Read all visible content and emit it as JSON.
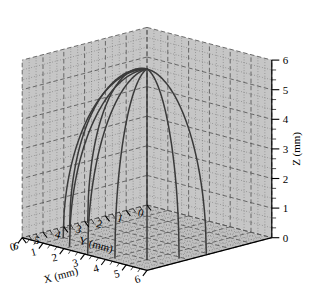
{
  "figure": {
    "name": "3d-dome-meridian-plot",
    "background": "#ffffff",
    "wall_fill": "#c6c6c6",
    "floor_fill": "#c0c0c0",
    "grid_color": "#555555",
    "curve_color": "#3a3a3a",
    "axis_color": "#000000"
  },
  "axes": {
    "x": {
      "label": "X (mm)",
      "unit": "mm",
      "min": 0,
      "max": 6,
      "ticks": [
        0,
        1,
        2,
        3,
        4,
        5,
        6
      ],
      "tick_labels": [
        "0",
        "1",
        "2",
        "3",
        "4",
        "5",
        "6"
      ],
      "minor_per_major": 2
    },
    "y": {
      "label": "Y (mm)",
      "unit": "mm",
      "min": 0,
      "max": 6,
      "ticks": [
        0,
        1,
        2,
        3,
        4,
        5,
        6
      ],
      "tick_labels": [
        "0",
        "1",
        "2",
        "3",
        "4",
        "5",
        "6"
      ],
      "minor_per_major": 2
    },
    "z": {
      "label": "Z (mm)",
      "unit": "mm",
      "min": 0,
      "max": 6,
      "ticks": [
        0,
        1,
        2,
        3,
        4,
        5,
        6
      ],
      "tick_labels": [
        "0",
        "1",
        "2",
        "3",
        "4",
        "5",
        "6"
      ],
      "minor_per_major": 2
    }
  },
  "chart_data": {
    "type": "line",
    "title": "",
    "xlabel": "X (mm)",
    "ylabel": "Y (mm)",
    "zlabel": "Z (mm)",
    "xlim": [
      0,
      6
    ],
    "ylim": [
      0,
      6
    ],
    "zlim": [
      0,
      6
    ],
    "grid": true,
    "legend": "none",
    "projection": "3d",
    "apex": {
      "x": 3.0,
      "y": 3.0,
      "z": 5.7
    },
    "base_center": {
      "x": 3.0,
      "y": 3.0,
      "z": 0.0
    },
    "base_radius": 2.85,
    "n_curves": 9,
    "series": [
      {
        "name": "meridian-1",
        "azimuth_deg": 0,
        "base_point": {
          "x": 5.85,
          "y": 3.0,
          "z": 0
        }
      },
      {
        "name": "meridian-2",
        "azimuth_deg": 22.5,
        "base_point": {
          "x": 5.63,
          "y": 4.09,
          "z": 0
        }
      },
      {
        "name": "meridian-3",
        "azimuth_deg": 45,
        "base_point": {
          "x": 5.02,
          "y": 5.02,
          "z": 0
        }
      },
      {
        "name": "meridian-4",
        "azimuth_deg": 67.5,
        "base_point": {
          "x": 4.09,
          "y": 5.63,
          "z": 0
        }
      },
      {
        "name": "meridian-5",
        "azimuth_deg": 90,
        "base_point": {
          "x": 3.0,
          "y": 5.85,
          "z": 0
        }
      },
      {
        "name": "meridian-6",
        "azimuth_deg": 112.5,
        "base_point": {
          "x": 1.91,
          "y": 5.63,
          "z": 0
        }
      },
      {
        "name": "meridian-7",
        "azimuth_deg": 135,
        "base_point": {
          "x": 0.98,
          "y": 5.02,
          "z": 0
        }
      },
      {
        "name": "meridian-8",
        "azimuth_deg": 157.5,
        "base_point": {
          "x": 0.37,
          "y": 4.09,
          "z": 0
        }
      },
      {
        "name": "meridian-9",
        "azimuth_deg": 180,
        "base_point": {
          "x": 0.15,
          "y": 3.0,
          "z": 0
        }
      }
    ],
    "curve_equation": "z = apex_z * sqrt(1 - (r/base_radius)^2) profile swept over azimuth",
    "sample_profile": {
      "r_over_R": [
        0.0,
        0.2,
        0.4,
        0.6,
        0.75,
        0.87,
        0.95,
        1.0
      ],
      "z": [
        5.7,
        5.58,
        5.22,
        4.56,
        3.77,
        2.81,
        1.78,
        0.0
      ]
    }
  }
}
